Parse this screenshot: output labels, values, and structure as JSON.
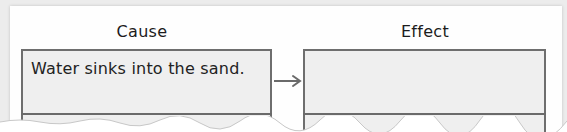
{
  "diagram": {
    "type": "cause-effect",
    "cause": {
      "heading": "Cause",
      "text": "Water sinks into the sand."
    },
    "effect": {
      "heading": "Effect",
      "text": ""
    },
    "connector": "arrow-right-icon"
  },
  "colors": {
    "page": "#fefefe",
    "box_fill": "#efefef",
    "box_border": "#6e6e6e",
    "text": "#1c1c1c"
  }
}
